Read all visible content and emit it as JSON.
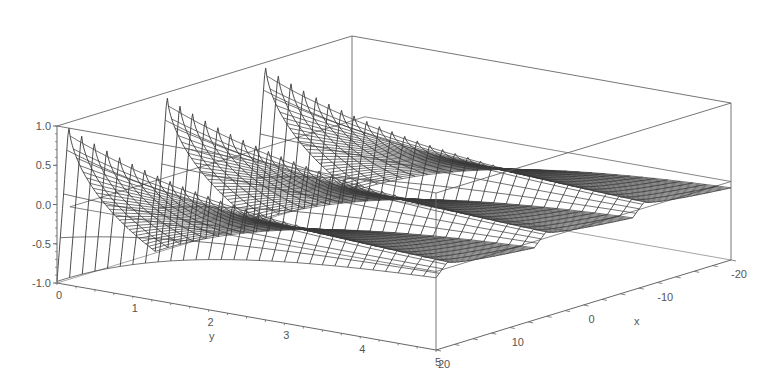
{
  "chart_data": {
    "type": "surface3d",
    "title": "",
    "xlabel": "x",
    "ylabel": "y",
    "zlabel": "",
    "x_range": [
      -20,
      20
    ],
    "y_range": [
      0,
      5
    ],
    "z_range": [
      -1.0,
      1.0
    ],
    "x_ticks": [
      20,
      10,
      0,
      -10,
      -20
    ],
    "y_ticks": [
      0,
      1,
      2,
      3,
      4,
      5
    ],
    "z_ticks": [
      "1.0",
      "0.5",
      "0.0",
      "-0.5",
      "-1.0"
    ],
    "x_tick_labels": [
      "20",
      "10",
      "0",
      "-10",
      "-20"
    ],
    "y_tick_labels": [
      "0",
      "1",
      "2",
      "3",
      "4",
      "5"
    ],
    "surface_description": "Wireframe surface with three sawtooth ridges along x that decay toward zero as y increases",
    "ridge_count": 3,
    "peak_z_at_y0": 1.0,
    "trough_z_at_y0": -1.0,
    "decay_rate": 0.5,
    "grid_resolution": {
      "x": 90,
      "y": 30
    },
    "render_style": "wireframe",
    "box": true,
    "zero_plane_outline": true
  },
  "style": {
    "background": "#ffffff",
    "mesh_color": "#3a3a3a",
    "box_color": "#666666",
    "label_color": "#555555"
  },
  "projection": {
    "origin_px": [
      57,
      283
    ],
    "y_unit_px": [
      75.8,
      13.4
    ],
    "x_unit_px": [
      -7.375,
      2.25
    ],
    "z_unit_px": [
      0,
      -78.5
    ],
    "x_origin": 20
  }
}
